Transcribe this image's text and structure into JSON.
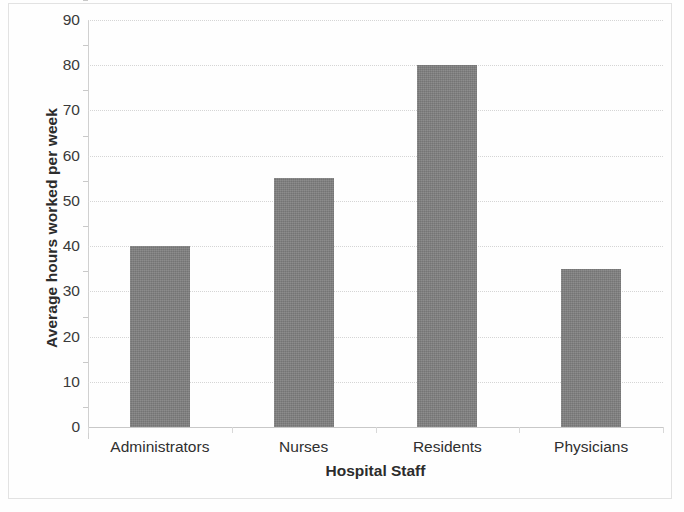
{
  "chart_data": {
    "type": "bar",
    "title": "",
    "xlabel": "Hospital Staff",
    "ylabel": "Average hours worked per week",
    "categories": [
      "Administrators",
      "Nurses",
      "Residents",
      "Physicians"
    ],
    "values": [
      40,
      55,
      80,
      35
    ],
    "ylim": [
      0,
      90
    ],
    "ytick_labels": [
      "0",
      "10",
      "20",
      "30",
      "40",
      "50",
      "60",
      "70",
      "80",
      "90"
    ],
    "ytick_values": [
      0,
      10,
      20,
      30,
      40,
      50,
      60,
      70,
      80,
      90
    ],
    "grid": true,
    "legend": false,
    "bar_color": "#808080",
    "gridline_color": "#d5d5d5",
    "axis_color": "#c8c8c8",
    "text_color": "#2f2f2f",
    "background": "#ffffff"
  }
}
